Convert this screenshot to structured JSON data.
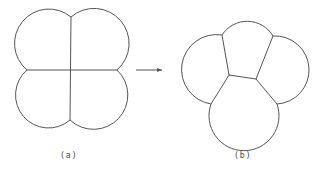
{
  "diagram": {
    "panels": [
      {
        "id": "a",
        "label": "(a)",
        "description": "Four bubbles meeting at a fourfold vertex"
      },
      {
        "id": "b",
        "label": "(b)",
        "description": "Four bubbles relaxed into two threefold vertices"
      }
    ],
    "arrow": {
      "from": "a",
      "to": "b"
    },
    "colors": {
      "stroke": "#555555",
      "background": "#ffffff",
      "text": "#444444"
    }
  }
}
